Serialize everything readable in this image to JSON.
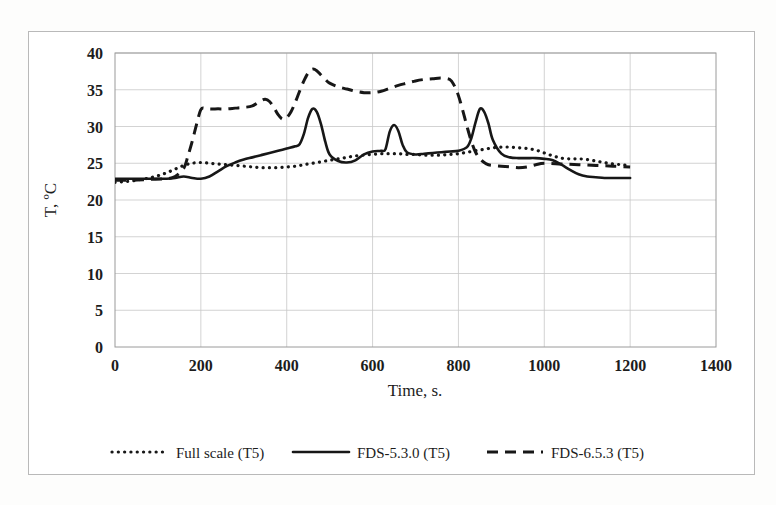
{
  "figure": {
    "background_color": "#ffffff",
    "frame_color": "#b9b9b9",
    "ink_color": "#171717"
  },
  "chart_data": {
    "type": "line",
    "title": "",
    "xlabel": "Time, s.",
    "ylabel": "T, ºC",
    "xlim": [
      0,
      1400
    ],
    "ylim": [
      0,
      40
    ],
    "xticks": [
      0,
      200,
      400,
      600,
      800,
      1000,
      1200,
      1400
    ],
    "xtick_labels": [
      "0",
      "200",
      "400",
      "600",
      "800",
      "1000",
      "1200",
      "1400"
    ],
    "yticks": [
      0,
      5,
      10,
      15,
      20,
      25,
      30,
      35,
      40
    ],
    "ytick_labels": [
      "0",
      "5",
      "10",
      "15",
      "20",
      "25",
      "30",
      "35",
      "40"
    ],
    "grid": true,
    "grid_axis": "y",
    "legend_position": "bottom",
    "series": [
      {
        "name": "Full scale (T5)",
        "style": "dotted",
        "color": "#171717",
        "x": [
          0,
          20,
          40,
          60,
          80,
          100,
          120,
          140,
          160,
          180,
          200,
          220,
          240,
          260,
          280,
          300,
          320,
          340,
          360,
          380,
          400,
          420,
          440,
          460,
          480,
          500,
          520,
          540,
          560,
          580,
          600,
          620,
          640,
          660,
          680,
          700,
          720,
          740,
          760,
          780,
          800,
          820,
          840,
          860,
          880,
          900,
          920,
          940,
          960,
          980,
          1000,
          1020,
          1040,
          1060,
          1080,
          1100,
          1120,
          1140,
          1160,
          1180,
          1200
        ],
        "y": [
          22.4,
          22.5,
          22.6,
          22.8,
          23.0,
          23.3,
          23.7,
          24.2,
          24.7,
          25.0,
          25.1,
          25.0,
          24.9,
          24.8,
          24.7,
          24.6,
          24.5,
          24.4,
          24.4,
          24.4,
          24.5,
          24.6,
          24.8,
          25.0,
          25.2,
          25.4,
          25.6,
          25.8,
          26.0,
          26.1,
          26.2,
          26.3,
          26.3,
          26.3,
          26.2,
          26.2,
          26.1,
          26.1,
          26.1,
          26.2,
          26.3,
          26.5,
          26.7,
          26.9,
          27.1,
          27.2,
          27.2,
          27.1,
          27.0,
          26.8,
          26.4,
          26.0,
          25.7,
          25.6,
          25.6,
          25.5,
          25.3,
          25.1,
          24.9,
          24.8,
          24.7
        ]
      },
      {
        "name": "FDS-5.3.0 (T5)",
        "style": "solid",
        "color": "#171717",
        "x": [
          0,
          20,
          40,
          60,
          80,
          100,
          120,
          140,
          160,
          180,
          200,
          220,
          240,
          260,
          280,
          300,
          320,
          340,
          360,
          380,
          400,
          420,
          430,
          440,
          450,
          460,
          470,
          480,
          490,
          500,
          520,
          540,
          560,
          580,
          600,
          620,
          630,
          640,
          650,
          660,
          670,
          680,
          700,
          720,
          740,
          760,
          780,
          800,
          820,
          830,
          840,
          850,
          860,
          870,
          880,
          900,
          920,
          940,
          960,
          980,
          1000,
          1020,
          1040,
          1060,
          1080,
          1100,
          1120,
          1140,
          1160,
          1180,
          1200
        ],
        "y": [
          22.9,
          22.9,
          22.9,
          22.9,
          22.9,
          22.9,
          22.9,
          23.0,
          23.2,
          23.0,
          22.9,
          23.2,
          23.9,
          24.6,
          25.1,
          25.5,
          25.8,
          26.1,
          26.4,
          26.7,
          27.0,
          27.3,
          27.6,
          29.0,
          31.2,
          32.4,
          32.0,
          30.3,
          27.9,
          26.2,
          25.3,
          25.1,
          25.4,
          26.2,
          26.6,
          26.7,
          26.9,
          29.3,
          30.2,
          29.4,
          27.5,
          26.5,
          26.2,
          26.3,
          26.4,
          26.5,
          26.6,
          26.7,
          27.2,
          28.4,
          30.6,
          32.4,
          32.0,
          30.4,
          28.2,
          26.3,
          25.8,
          25.7,
          25.7,
          25.7,
          25.6,
          25.4,
          24.8,
          24.1,
          23.5,
          23.2,
          23.1,
          23.0,
          23.0,
          23.0,
          23.0
        ]
      },
      {
        "name": "FDS-6.5.3 (T5)",
        "style": "dashed",
        "color": "#171717",
        "x": [
          0,
          40,
          80,
          120,
          140,
          160,
          170,
          180,
          190,
          200,
          210,
          220,
          240,
          260,
          280,
          300,
          320,
          340,
          350,
          360,
          370,
          380,
          390,
          400,
          410,
          420,
          430,
          440,
          450,
          460,
          470,
          480,
          490,
          500,
          520,
          540,
          560,
          580,
          600,
          620,
          640,
          660,
          680,
          700,
          720,
          740,
          760,
          780,
          790,
          800,
          810,
          820,
          830,
          840,
          850,
          860,
          870,
          880,
          900,
          920,
          940,
          960,
          980,
          1000,
          1040,
          1080,
          1120,
          1160,
          1200
        ],
        "y": [
          22.7,
          22.7,
          22.8,
          22.9,
          23.2,
          24.3,
          26.0,
          28.0,
          30.3,
          32.3,
          32.5,
          32.4,
          32.4,
          32.4,
          32.5,
          32.6,
          32.8,
          33.5,
          33.7,
          33.4,
          32.6,
          31.6,
          31.0,
          31.2,
          32.0,
          33.3,
          34.8,
          36.2,
          37.3,
          37.8,
          37.6,
          37.0,
          36.4,
          35.9,
          35.4,
          35.1,
          34.8,
          34.6,
          34.6,
          34.8,
          35.2,
          35.6,
          35.9,
          36.2,
          36.4,
          36.5,
          36.6,
          36.4,
          35.6,
          34.2,
          32.2,
          30.0,
          28.0,
          26.5,
          25.6,
          25.1,
          24.8,
          24.7,
          24.6,
          24.5,
          24.4,
          24.5,
          24.8,
          25.0,
          24.9,
          24.8,
          24.7,
          24.6,
          24.5
        ]
      }
    ]
  },
  "legend": {
    "items": [
      {
        "label": "Full scale (T5)",
        "style": "dotted"
      },
      {
        "label": "FDS-5.3.0 (T5)",
        "style": "solid"
      },
      {
        "label": "FDS-6.5.3 (T5)",
        "style": "dashed"
      }
    ]
  }
}
